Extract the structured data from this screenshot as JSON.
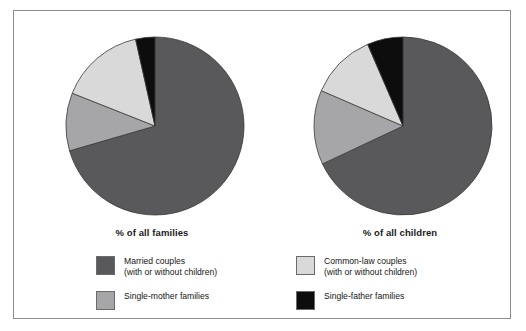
{
  "figure": {
    "background": "#ffffff",
    "frame_border_color": "#8c8c8c"
  },
  "colors": {
    "married_couples": "#59595b",
    "common_law_couples": "#d9d9d9",
    "single_mother": "#a6a6a8",
    "single_father": "#0d0d0d",
    "slice_outline": "#3a3a3a",
    "text": "#161616"
  },
  "charts": [
    {
      "id": "families",
      "caption": "% of all families",
      "center_x": 103,
      "center_y": 95,
      "radius": 89
    },
    {
      "id": "children",
      "caption": "% of all children",
      "center_x": 103,
      "center_y": 95,
      "radius": 89
    }
  ],
  "legend": {
    "items": [
      {
        "key": "married_couples",
        "label": "Married couples\n(with or without children)",
        "swatch_color": "#59595b",
        "column": "left"
      },
      {
        "key": "common_law_couples",
        "label": "Common-law couples\n(with or without children)",
        "swatch_color": "#d9d9d9",
        "column": "right"
      },
      {
        "key": "single_mother",
        "label": "Single-mother families",
        "swatch_color": "#a6a6a8",
        "column": "left"
      },
      {
        "key": "single_father",
        "label": "Single-father families",
        "swatch_color": "#0d0d0d",
        "column": "right"
      }
    ]
  },
  "chart_data": [
    {
      "type": "pie",
      "title": "% of all families",
      "labels": [
        "Married couples (with or without children)",
        "Single-mother families",
        "Common-law couples (with or without children)",
        "Single-father families"
      ],
      "values": [
        70.5,
        10.5,
        15.5,
        3.5
      ],
      "colors": [
        "#59595b",
        "#a6a6a8",
        "#d9d9d9",
        "#0d0d0d"
      ],
      "start_angle_deg": 0,
      "direction": "clockwise",
      "legend_position": "bottom",
      "grid": false
    },
    {
      "type": "pie",
      "title": "% of all children",
      "labels": [
        "Married couples (with or without children)",
        "Single-mother families",
        "Common-law couples (with or without children)",
        "Single-father families"
      ],
      "values": [
        68.0,
        13.5,
        12.0,
        6.5
      ],
      "colors": [
        "#59595b",
        "#a6a6a8",
        "#d9d9d9",
        "#0d0d0d"
      ],
      "start_angle_deg": 0,
      "direction": "clockwise",
      "legend_position": "bottom",
      "grid": false
    }
  ]
}
